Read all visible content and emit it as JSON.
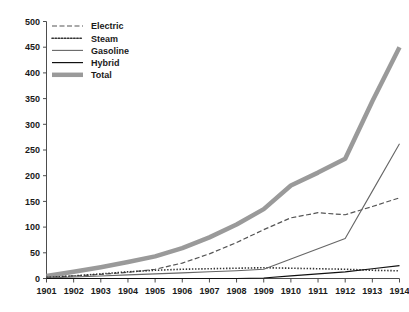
{
  "chart_data": {
    "type": "line",
    "title": "",
    "subtitle": "",
    "xlabel": "",
    "ylabel": "",
    "grid": false,
    "legend_position": "top-left",
    "x": [
      1901,
      1902,
      1903,
      1904,
      1905,
      1906,
      1907,
      1908,
      1909,
      1910,
      1911,
      1912,
      1913,
      1914
    ],
    "categories": [
      "1901",
      "1902",
      "1903",
      "1904",
      "1905",
      "1906",
      "1907",
      "1908",
      "1909",
      "1910",
      "1911",
      "1912",
      "1913",
      "1914"
    ],
    "xlim": [
      1901,
      1914
    ],
    "ylim": [
      0,
      500
    ],
    "yticks": [
      0,
      50,
      100,
      150,
      200,
      250,
      300,
      350,
      400,
      450,
      500
    ],
    "ytick_labels": [
      "0",
      "50",
      "100",
      "150",
      "200",
      "250",
      "300",
      "350",
      "400",
      "450",
      "500"
    ],
    "xticks": [
      1901,
      1902,
      1903,
      1904,
      1905,
      1906,
      1907,
      1908,
      1909,
      1910,
      1911,
      1912,
      1913,
      1914
    ],
    "series": [
      {
        "name": "Electric",
        "style": "dashed",
        "color": "#555555",
        "width": 1.2,
        "values": [
          2,
          5,
          8,
          12,
          18,
          30,
          48,
          70,
          95,
          118,
          128,
          124,
          140,
          157
        ]
      },
      {
        "name": "Steam",
        "style": "dotted",
        "color": "#333333",
        "width": 1.6,
        "values": [
          2,
          5,
          9,
          13,
          16,
          18,
          19,
          20,
          21,
          20,
          19,
          18,
          16,
          15
        ]
      },
      {
        "name": "Gasoline",
        "style": "solid",
        "color": "#666666",
        "width": 1.1,
        "values": [
          1,
          3,
          5,
          7,
          9,
          11,
          13,
          15,
          18,
          38,
          58,
          78,
          170,
          262
        ]
      },
      {
        "name": "Hybrid",
        "style": "solid",
        "color": "#111111",
        "width": 1.2,
        "values": [
          0,
          0,
          0,
          0,
          0,
          0,
          0,
          0,
          1,
          5,
          9,
          13,
          19,
          25
        ]
      },
      {
        "name": "Total",
        "style": "thick",
        "color": "#9a9a9a",
        "width": 4.5,
        "values": [
          5,
          13,
          22,
          32,
          43,
          59,
          80,
          105,
          135,
          181,
          206,
          233,
          345,
          450
        ]
      }
    ],
    "legend": [
      {
        "label": "Electric",
        "style": "dashed"
      },
      {
        "label": "Steam",
        "style": "dotted"
      },
      {
        "label": "Gasoline",
        "style": "solid-gray"
      },
      {
        "label": "Hybrid",
        "style": "solid-black"
      },
      {
        "label": "Total",
        "style": "thick-gray"
      }
    ]
  },
  "colors": {
    "background": "#ffffff",
    "axis": "#4d4d4d",
    "text": "#1a1a1a",
    "electric": "#555555",
    "steam": "#333333",
    "gasoline": "#666666",
    "hybrid": "#111111",
    "total": "#9a9a9a"
  }
}
